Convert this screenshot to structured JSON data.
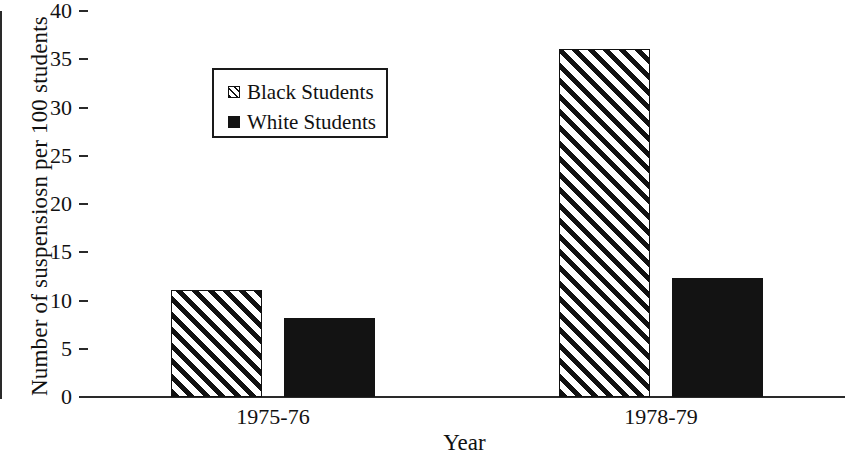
{
  "chart_data": {
    "type": "bar",
    "title": "",
    "xlabel": "Year",
    "ylabel": "Number of suspensiosn per 100 students",
    "categories": [
      "1975-76",
      "1978-79"
    ],
    "series": [
      {
        "name": "Black Students",
        "values": [
          11.1,
          36.1
        ],
        "fill": "hatch-diagonal",
        "color": "#111111"
      },
      {
        "name": "White Students",
        "values": [
          8.2,
          12.3
        ],
        "fill": "solid",
        "color": "#131313"
      }
    ],
    "ylim": [
      0,
      40
    ],
    "yticks": [
      0,
      5,
      10,
      15,
      20,
      25,
      30,
      35,
      40
    ],
    "ytick_labels": [
      "0",
      "5",
      "10",
      "15",
      "20",
      "25",
      "30",
      "35",
      "40"
    ],
    "grid": false,
    "legend_position": "upper-left-inside",
    "legend_entries": [
      "Black Students",
      "White Students"
    ]
  },
  "axes": {
    "y_title": "Number of suspensiosn per 100 students",
    "x_title": "Year"
  },
  "legend": {
    "entries": [
      {
        "label": "Black Students",
        "swatch": "hatched-square-icon"
      },
      {
        "label": "White Students",
        "swatch": "filled-square-icon"
      }
    ]
  }
}
